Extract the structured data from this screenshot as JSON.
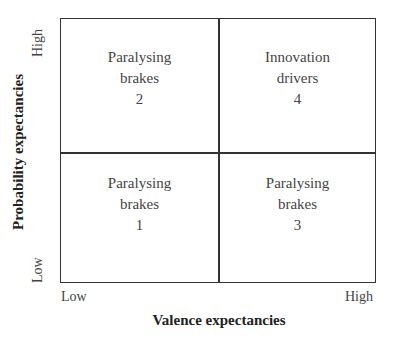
{
  "diagram": {
    "type": "2x2 matrix",
    "x_axis": {
      "label": "Valence expectancies",
      "low": "Low",
      "high": "High"
    },
    "y_axis": {
      "label": "Probability expectancies",
      "low": "Low",
      "high": "High"
    },
    "quadrants": {
      "top_left": {
        "line1": "Paralysing",
        "line2": "brakes",
        "number": "2"
      },
      "top_right": {
        "line1": "Innovation",
        "line2": "drivers",
        "number": "4"
      },
      "bottom_left": {
        "line1": "Paralysing",
        "line2": "brakes",
        "number": "1"
      },
      "bottom_right": {
        "line1": "Paralysing",
        "line2": "brakes",
        "number": "3"
      }
    }
  }
}
